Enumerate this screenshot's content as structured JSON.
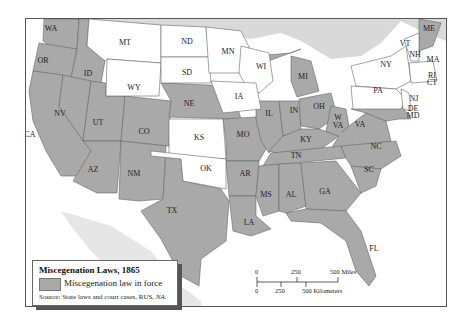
{
  "map": {
    "title": "Miscegenation Laws, 1865",
    "colors": {
      "law_in_force": "#a9a9a9",
      "no_law": "#ffffff",
      "water": "#d9d9d9",
      "foreign_land": "#e6e6e6",
      "border": "#555555"
    },
    "states_with_law": [
      "WA",
      "OR",
      "CA",
      "NV",
      "ID",
      "UT",
      "AZ",
      "CO",
      "NM",
      "TX",
      "NE",
      "MO",
      "AR",
      "LA",
      "IL",
      "IN",
      "MI",
      "OH",
      "KY",
      "TN",
      "MS",
      "AL",
      "GA",
      "FL",
      "SC",
      "NC",
      "VA",
      "W VA",
      "MD",
      "DE",
      "ME"
    ],
    "states_without_law": [
      "MT",
      "WY",
      "ND",
      "SD",
      "MN",
      "WI",
      "IA",
      "KS",
      "OK",
      "NY",
      "PA",
      "NJ",
      "VT",
      "NH",
      "MA",
      "RI",
      "CT"
    ],
    "state_labels": [
      {
        "abbr": "WA",
        "x": 50,
        "y": 30
      },
      {
        "abbr": "OR",
        "x": 42,
        "y": 62
      },
      {
        "abbr": "ID",
        "x": 87,
        "y": 75
      },
      {
        "abbr": "MT",
        "x": 124,
        "y": 44
      },
      {
        "abbr": "WY",
        "x": 133,
        "y": 89
      },
      {
        "abbr": "ND",
        "x": 186,
        "y": 43
      },
      {
        "abbr": "SD",
        "x": 186,
        "y": 74
      },
      {
        "abbr": "NE",
        "x": 188,
        "y": 105
      },
      {
        "abbr": "MN",
        "x": 227,
        "y": 53
      },
      {
        "abbr": "WI",
        "x": 260,
        "y": 68
      },
      {
        "abbr": "IA",
        "x": 238,
        "y": 98
      },
      {
        "abbr": "MI",
        "x": 302,
        "y": 78
      },
      {
        "abbr": "NV",
        "x": 59,
        "y": 115
      },
      {
        "abbr": "UT",
        "x": 97,
        "y": 124
      },
      {
        "abbr": "CO",
        "x": 143,
        "y": 133
      },
      {
        "abbr": "CA",
        "x": 29,
        "y": 136
      },
      {
        "abbr": "KS",
        "x": 198,
        "y": 139
      },
      {
        "abbr": "MO",
        "x": 242,
        "y": 136
      },
      {
        "abbr": "IL",
        "x": 268,
        "y": 115
      },
      {
        "abbr": "IN",
        "x": 293,
        "y": 112
      },
      {
        "abbr": "OH",
        "x": 318,
        "y": 108
      },
      {
        "abbr": "KY",
        "x": 305,
        "y": 141
      },
      {
        "abbr": "W VA",
        "x": 337,
        "y": 119
      },
      {
        "abbr": "VA",
        "x": 359,
        "y": 126
      },
      {
        "abbr": "AZ",
        "x": 92,
        "y": 171
      },
      {
        "abbr": "NM",
        "x": 133,
        "y": 175
      },
      {
        "abbr": "OK",
        "x": 205,
        "y": 170
      },
      {
        "abbr": "AR",
        "x": 244,
        "y": 175
      },
      {
        "abbr": "TN",
        "x": 295,
        "y": 157
      },
      {
        "abbr": "NC",
        "x": 375,
        "y": 148
      },
      {
        "abbr": "SC",
        "x": 368,
        "y": 171
      },
      {
        "abbr": "MS",
        "x": 265,
        "y": 196
      },
      {
        "abbr": "AL",
        "x": 290,
        "y": 196
      },
      {
        "abbr": "GA",
        "x": 324,
        "y": 193
      },
      {
        "abbr": "TX",
        "x": 171,
        "y": 212
      },
      {
        "abbr": "LA",
        "x": 248,
        "y": 224
      },
      {
        "abbr": "FL",
        "x": 373,
        "y": 250
      },
      {
        "abbr": "NY",
        "x": 385,
        "y": 66
      },
      {
        "abbr": "PA",
        "x": 377,
        "y": 92
      },
      {
        "abbr": "NJ",
        "x": 413,
        "y": 100
      },
      {
        "abbr": "DE",
        "x": 412,
        "y": 110
      },
      {
        "abbr": "MD",
        "x": 412,
        "y": 117
      },
      {
        "abbr": "VT",
        "x": 404,
        "y": 45
      },
      {
        "abbr": "NH",
        "x": 414,
        "y": 56
      },
      {
        "abbr": "MA",
        "x": 432,
        "y": 61
      },
      {
        "abbr": "RI",
        "x": 431,
        "y": 77
      },
      {
        "abbr": "CT",
        "x": 431,
        "y": 84
      },
      {
        "abbr": "ME",
        "x": 428,
        "y": 30
      }
    ]
  },
  "legend": {
    "title": "Miscegenation Laws, 1865",
    "item_label": "Miscegenation law in force",
    "source_prefix": "Source:  State laws and court cases, RUS, ",
    "source_italic": "NA."
  },
  "scale_bar": {
    "miles_ticks": [
      "0",
      "250",
      "500 Miles"
    ],
    "km_ticks": [
      "0",
      "250",
      "500 Kilometers"
    ]
  }
}
